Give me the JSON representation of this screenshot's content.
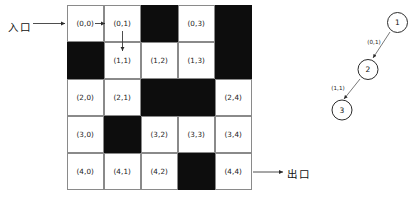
{
  "diagram": {
    "entrance": {
      "label": "入口",
      "arrow": "right-arrow-icon",
      "target_cell": "(0,0)"
    },
    "exit": {
      "label": "出口",
      "arrow": "right-arrow-icon",
      "source_cell": "(4,4)"
    },
    "colors": {
      "wall": "#0d0d0d",
      "path": "#ffffff",
      "grid_line": "#8a8a8a",
      "ink": "#1a1a1a"
    }
  },
  "grid": {
    "rows": 5,
    "cols": 5,
    "cells": [
      [
        {
          "label": "(0,0)",
          "wall": false
        },
        {
          "label": "(0,1)",
          "wall": false
        },
        {
          "label": "(0,2)",
          "wall": true
        },
        {
          "label": "(0,3)",
          "wall": false
        },
        {
          "label": "(0,4)",
          "wall": true
        }
      ],
      [
        {
          "label": "(1,0)",
          "wall": true
        },
        {
          "label": "(1,1)",
          "wall": false
        },
        {
          "label": "(1,2)",
          "wall": false
        },
        {
          "label": "(1,3)",
          "wall": false
        },
        {
          "label": "(1,4)",
          "wall": true
        }
      ],
      [
        {
          "label": "(2,0)",
          "wall": false
        },
        {
          "label": "(2,1)",
          "wall": false
        },
        {
          "label": "(2,2)",
          "wall": true
        },
        {
          "label": "(2,3)",
          "wall": true
        },
        {
          "label": "(2,4)",
          "wall": false
        }
      ],
      [
        {
          "label": "(3,0)",
          "wall": false
        },
        {
          "label": "(3,1)",
          "wall": true
        },
        {
          "label": "(3,2)",
          "wall": false
        },
        {
          "label": "(3,3)",
          "wall": false
        },
        {
          "label": "(3,4)",
          "wall": false
        }
      ],
      [
        {
          "label": "(4,0)",
          "wall": false
        },
        {
          "label": "(4,1)",
          "wall": false
        },
        {
          "label": "(4,2)",
          "wall": false
        },
        {
          "label": "(4,3)",
          "wall": true
        },
        {
          "label": "(4,4)",
          "wall": false
        }
      ]
    ]
  },
  "path_arrows": [
    {
      "name": "arrow-00-to-01",
      "from": "(0,0)",
      "to": "(0,1)",
      "direction": "right"
    },
    {
      "name": "arrow-01-to-11",
      "from": "(0,1)",
      "to": "(1,1)",
      "direction": "down"
    }
  ],
  "search_tree": {
    "nodes": [
      {
        "id": "1",
        "label": "1"
      },
      {
        "id": "2",
        "label": "2"
      },
      {
        "id": "3",
        "label": "3"
      }
    ],
    "edges": [
      {
        "from": "1",
        "to": "2",
        "label": "(0,1)"
      },
      {
        "from": "2",
        "to": "3",
        "label": "(1,1)"
      }
    ]
  }
}
